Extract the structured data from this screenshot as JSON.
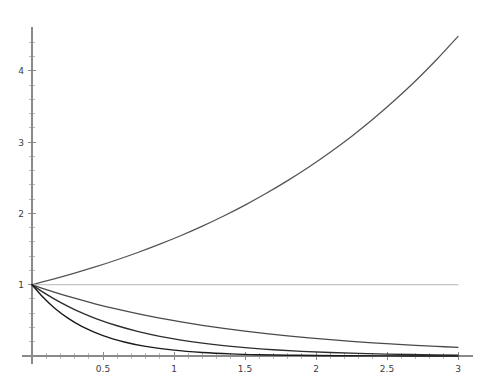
{
  "chart_data": {
    "type": "line",
    "title": "",
    "subtitle": "",
    "xlabel": "",
    "ylabel": "",
    "xlim": [
      0,
      3.02
    ],
    "ylim": [
      0,
      4.62
    ],
    "grid": false,
    "legend": null,
    "axis_origin": [
      0,
      0
    ],
    "x_ticks": [
      {
        "value": 0.5,
        "label": "0.5"
      },
      {
        "value": 1,
        "label": "1"
      },
      {
        "value": 1.5,
        "label": "1.5"
      },
      {
        "value": 2,
        "label": "2"
      },
      {
        "value": 2.5,
        "label": "2.5"
      },
      {
        "value": 3,
        "label": "3"
      }
    ],
    "x_minor_ticks": [
      0.1,
      0.2,
      0.3,
      0.4,
      0.6,
      0.7,
      0.8,
      0.9,
      1.1,
      1.2,
      1.3,
      1.4,
      1.6,
      1.7,
      1.8,
      1.9,
      2.1,
      2.2,
      2.3,
      2.4,
      2.6,
      2.7,
      2.8,
      2.9
    ],
    "y_ticks": [
      {
        "value": 1,
        "label": "1"
      },
      {
        "value": 2,
        "label": "2"
      },
      {
        "value": 3,
        "label": "3"
      },
      {
        "value": 4,
        "label": "4"
      }
    ],
    "y_minor_ticks": [
      0.2,
      0.4,
      0.6,
      0.8,
      1.2,
      1.4,
      1.6,
      1.8,
      2.2,
      2.4,
      2.6,
      2.8,
      3.2,
      3.4,
      3.6,
      3.8,
      4.2,
      4.4
    ],
    "series": [
      {
        "name": "growing-exponential",
        "color": "#555555",
        "width": 1.3,
        "x": [
          0,
          0.15,
          0.3,
          0.45,
          0.6,
          0.75,
          0.9,
          1.05,
          1.2,
          1.35,
          1.5,
          1.65,
          1.8,
          1.95,
          2.1,
          2.25,
          2.4,
          2.55,
          2.7,
          2.85,
          3
        ],
        "y": [
          1,
          1.078,
          1.162,
          1.252,
          1.35,
          1.455,
          1.568,
          1.69,
          1.822,
          1.964,
          2.117,
          2.282,
          2.46,
          2.651,
          2.858,
          3.08,
          3.32,
          3.579,
          3.857,
          4.158,
          4.482
        ]
      },
      {
        "name": "constant-one",
        "color": "#c4c4c4",
        "width": 1.2,
        "x": [
          0,
          3
        ],
        "y": [
          1,
          1
        ]
      },
      {
        "name": "slow-decay",
        "color": "#4a4a4a",
        "width": 1.3,
        "x": [
          0,
          0.15,
          0.3,
          0.45,
          0.6,
          0.75,
          0.9,
          1.05,
          1.2,
          1.35,
          1.5,
          1.65,
          1.8,
          1.95,
          2.1,
          2.25,
          2.4,
          2.55,
          2.7,
          2.85,
          3
        ],
        "y": [
          1,
          0.9,
          0.81,
          0.729,
          0.656,
          0.59,
          0.531,
          0.478,
          0.43,
          0.387,
          0.349,
          0.314,
          0.282,
          0.254,
          0.229,
          0.206,
          0.185,
          0.167,
          0.15,
          0.135,
          0.122
        ]
      },
      {
        "name": "medium-decay",
        "color": "#2d2d2d",
        "width": 1.4,
        "x": [
          0,
          0.1,
          0.2,
          0.3,
          0.45,
          0.6,
          0.75,
          0.9,
          1.05,
          1.2,
          1.35,
          1.5,
          1.7,
          1.9,
          2.1,
          2.3,
          2.5,
          2.75,
          3
        ],
        "y": [
          1,
          0.867,
          0.751,
          0.651,
          0.525,
          0.424,
          0.342,
          0.276,
          0.223,
          0.18,
          0.145,
          0.117,
          0.0873,
          0.0651,
          0.0486,
          0.0362,
          0.027,
          0.0185,
          0.0127
        ]
      },
      {
        "name": "fast-decay",
        "color": "#1a1a1a",
        "width": 1.4,
        "x": [
          0,
          0.08,
          0.16,
          0.25,
          0.35,
          0.5,
          0.65,
          0.8,
          1,
          1.2,
          1.4,
          1.6,
          1.8,
          2,
          2.25,
          2.5,
          2.75,
          3
        ],
        "y": [
          1,
          0.819,
          0.67,
          0.535,
          0.417,
          0.287,
          0.197,
          0.135,
          0.0821,
          0.05,
          0.0304,
          0.0185,
          0.0112,
          0.0068,
          0.00335,
          0.00165,
          0.00081,
          0.0004
        ]
      }
    ]
  },
  "canvas": {
    "width": 489,
    "height": 387,
    "background": "#ffffff",
    "origin_px": [
      32,
      356
    ],
    "unit_px": [
      142.0,
      71.3
    ]
  }
}
